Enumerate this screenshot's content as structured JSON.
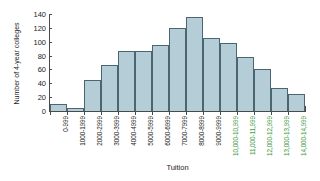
{
  "chart_data": {
    "type": "bar",
    "title": "",
    "xlabel": "Tuition",
    "ylabel": "Number of 4-year colleges",
    "grid": false,
    "legend": "none",
    "ylim": [
      0,
      140
    ],
    "y_ticks": [
      0,
      20,
      40,
      60,
      80,
      100,
      120,
      140
    ],
    "categories": [
      "0-999",
      "1000-1999",
      "2000-2999",
      "3000-3999",
      "4000-4999",
      "5000-5999",
      "6000-6999",
      "7000-7999",
      "8000-8999",
      "9000-9999",
      "10,000-10,999",
      "11,000-11,999",
      "12,000-12,999",
      "13,000-13,999",
      "14,000-14,999"
    ],
    "values": [
      10,
      5,
      45,
      66,
      86,
      86,
      96,
      120,
      135,
      105,
      98,
      78,
      60,
      33,
      25
    ],
    "category_label_colors": [
      "#1c1c1c",
      "#1c1c1c",
      "#1c1c1c",
      "#1c1c1c",
      "#1c1c1c",
      "#1c1c1c",
      "#1c1c1c",
      "#1c1c1c",
      "#1c1c1c",
      "#1c1c1c",
      "#3e9a3e",
      "#3e9a3e",
      "#3e9a3e",
      "#3e9a3e",
      "#3e9a3e"
    ],
    "bar_fill_color": "#b4cdd6",
    "bar_border_color": "#4a6670",
    "axis_color": "#4a4a4a",
    "highlight_color": "#3e9a3e",
    "background_color": "#ffffff"
  }
}
